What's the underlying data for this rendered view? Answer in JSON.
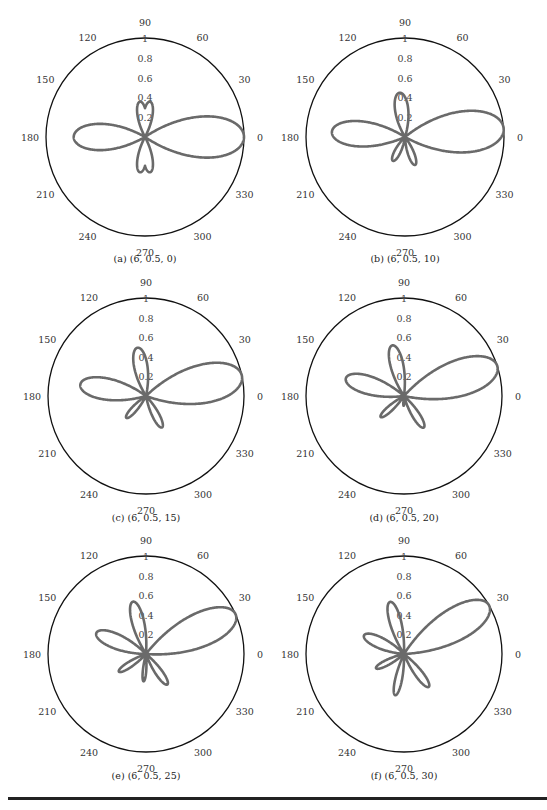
{
  "figure": {
    "rule_visible": true
  },
  "chart_data": [
    {
      "type": "polar",
      "id": "a",
      "caption": "(a) (6, 0.5, 0)",
      "params": [
        6,
        0.5,
        0
      ],
      "rlim": [
        0,
        1
      ],
      "radial_ticks": [
        "0.2",
        "0.4",
        "0.6",
        "0.8",
        "1"
      ],
      "angle_ticks": [
        "0",
        "30",
        "60",
        "90",
        "120",
        "150",
        "180",
        "210",
        "240",
        "270",
        "300",
        "330"
      ],
      "lobes": [
        {
          "angle": 0,
          "amp": 1.0,
          "width": 34
        },
        {
          "angle": 180,
          "amp": 0.72,
          "width": 30
        },
        {
          "angle": 82,
          "amp": 0.36,
          "width": 20
        },
        {
          "angle": 98,
          "amp": 0.36,
          "width": 20
        },
        {
          "angle": 262,
          "amp": 0.36,
          "width": 20
        },
        {
          "angle": 278,
          "amp": 0.36,
          "width": 20
        }
      ]
    },
    {
      "type": "polar",
      "id": "b",
      "caption": "(b) (6, 0.5, 10)",
      "params": [
        6,
        0.5,
        10
      ],
      "rlim": [
        0,
        1
      ],
      "radial_ticks": [
        "0.2",
        "0.4",
        "0.6",
        "0.8",
        "1"
      ],
      "angle_ticks": [
        "0",
        "30",
        "60",
        "90",
        "120",
        "150",
        "180",
        "210",
        "240",
        "270",
        "300",
        "330"
      ],
      "lobes": [
        {
          "angle": 5,
          "amp": 1.0,
          "width": 34
        },
        {
          "angle": 176,
          "amp": 0.74,
          "width": 28
        },
        {
          "angle": 97,
          "amp": 0.45,
          "width": 24
        },
        {
          "angle": 243,
          "amp": 0.27,
          "width": 18
        },
        {
          "angle": 290,
          "amp": 0.3,
          "width": 17
        }
      ]
    },
    {
      "type": "polar",
      "id": "c",
      "caption": "(c) (6, 0.5, 15)",
      "params": [
        6,
        0.5,
        15
      ],
      "rlim": [
        0,
        1
      ],
      "radial_ticks": [
        "0.2",
        "0.4",
        "0.6",
        "0.8",
        "1"
      ],
      "angle_ticks": [
        "0",
        "30",
        "60",
        "90",
        "120",
        "150",
        "180",
        "210",
        "240",
        "270",
        "300",
        "330"
      ],
      "lobes": [
        {
          "angle": 12,
          "amp": 1.0,
          "width": 32
        },
        {
          "angle": 170,
          "amp": 0.68,
          "width": 26
        },
        {
          "angle": 100,
          "amp": 0.5,
          "width": 22
        },
        {
          "angle": 228,
          "amp": 0.3,
          "width": 15
        },
        {
          "angle": 297,
          "amp": 0.36,
          "width": 16
        }
      ]
    },
    {
      "type": "polar",
      "id": "d",
      "caption": "(d) (6, 0.5, 20)",
      "params": [
        6,
        0.5,
        20
      ],
      "rlim": [
        0,
        1
      ],
      "radial_ticks": [
        "0.2",
        "0.4",
        "0.6",
        "0.8",
        "1"
      ],
      "angle_ticks": [
        "0",
        "30",
        "60",
        "90",
        "120",
        "150",
        "180",
        "210",
        "240",
        "270",
        "300",
        "330"
      ],
      "lobes": [
        {
          "angle": 18,
          "amp": 1.0,
          "width": 30
        },
        {
          "angle": 163,
          "amp": 0.62,
          "width": 24
        },
        {
          "angle": 103,
          "amp": 0.53,
          "width": 20
        },
        {
          "angle": 222,
          "amp": 0.32,
          "width": 14
        },
        {
          "angle": 268,
          "amp": 0.1,
          "width": 8
        },
        {
          "angle": 302,
          "amp": 0.38,
          "width": 16
        }
      ]
    },
    {
      "type": "polar",
      "id": "e",
      "caption": "(e) (6, 0.5, 25)",
      "params": [
        6,
        0.5,
        25
      ],
      "rlim": [
        0,
        1
      ],
      "radial_ticks": [
        "0.2",
        "0.4",
        "0.6",
        "0.8",
        "1"
      ],
      "angle_ticks": [
        "0",
        "30",
        "60",
        "90",
        "120",
        "150",
        "180",
        "210",
        "240",
        "270",
        "300",
        "330"
      ],
      "lobes": [
        {
          "angle": 24,
          "amp": 1.0,
          "width": 28
        },
        {
          "angle": 157,
          "amp": 0.55,
          "width": 22
        },
        {
          "angle": 104,
          "amp": 0.55,
          "width": 18
        },
        {
          "angle": 213,
          "amp": 0.33,
          "width": 14
        },
        {
          "angle": 265,
          "amp": 0.28,
          "width": 10
        },
        {
          "angle": 305,
          "amp": 0.38,
          "width": 15
        }
      ]
    },
    {
      "type": "polar",
      "id": "f",
      "caption": "(f) (6, 0.5, 30)",
      "params": [
        6,
        0.5,
        30
      ],
      "rlim": [
        0,
        1
      ],
      "radial_ticks": [
        "0.2",
        "0.4",
        "0.6",
        "0.8",
        "1"
      ],
      "angle_ticks": [
        "0",
        "30",
        "60",
        "90",
        "120",
        "150",
        "180",
        "210",
        "240",
        "270",
        "300",
        "330"
      ],
      "lobes": [
        {
          "angle": 30,
          "amp": 1.0,
          "width": 27
        },
        {
          "angle": 155,
          "amp": 0.45,
          "width": 20
        },
        {
          "angle": 105,
          "amp": 0.55,
          "width": 17
        },
        {
          "angle": 207,
          "amp": 0.32,
          "width": 14
        },
        {
          "angle": 258,
          "amp": 0.43,
          "width": 13
        },
        {
          "angle": 307,
          "amp": 0.42,
          "width": 15
        }
      ]
    }
  ],
  "style": {
    "curve_color": "#6a6a6a",
    "axis_color": "#111111"
  }
}
